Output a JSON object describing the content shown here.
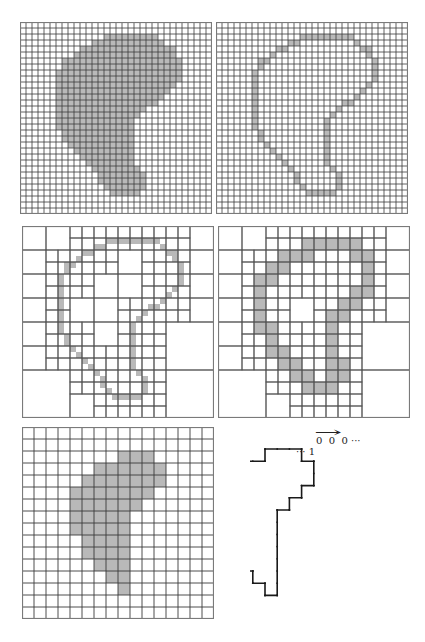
{
  "figure": {
    "colors": {
      "fill": "#b9b9b9",
      "grid_fine": "#3a3a3a",
      "grid_coarse": "#555555",
      "border": "#7a7a7a",
      "contour": "#1a1a1a"
    },
    "panels": [
      {
        "id": "fine-grid-filled",
        "x": 20,
        "y": 22,
        "size": 192,
        "n": 32,
        "mode": "fill",
        "rows": [
          [
            2,
            14,
            22
          ],
          [
            3,
            12,
            23
          ],
          [
            4,
            10,
            25
          ],
          [
            5,
            9,
            25
          ],
          [
            6,
            7,
            26
          ],
          [
            7,
            7,
            26
          ],
          [
            8,
            6,
            26
          ],
          [
            9,
            6,
            26
          ],
          [
            10,
            6,
            25
          ],
          [
            11,
            6,
            24
          ],
          [
            12,
            6,
            23
          ],
          [
            13,
            6,
            22
          ],
          [
            14,
            6,
            20
          ],
          [
            15,
            6,
            19
          ],
          [
            16,
            6,
            18
          ],
          [
            17,
            6,
            18
          ],
          [
            18,
            7,
            18
          ],
          [
            19,
            7,
            18
          ],
          [
            20,
            8,
            18
          ],
          [
            21,
            9,
            18
          ],
          [
            22,
            10,
            18
          ],
          [
            23,
            11,
            18
          ],
          [
            24,
            12,
            19
          ],
          [
            25,
            13,
            20
          ],
          [
            26,
            13,
            20
          ],
          [
            27,
            14,
            20
          ],
          [
            28,
            15,
            19
          ]
        ]
      },
      {
        "id": "fine-grid-boundary",
        "x": 216,
        "y": 22,
        "size": 192,
        "n": 32,
        "mode": "boundary",
        "rows": [
          [
            2,
            14,
            22
          ],
          [
            3,
            12,
            23
          ],
          [
            4,
            10,
            25
          ],
          [
            5,
            9,
            25
          ],
          [
            6,
            7,
            26
          ],
          [
            7,
            7,
            26
          ],
          [
            8,
            6,
            26
          ],
          [
            9,
            6,
            26
          ],
          [
            10,
            6,
            25
          ],
          [
            11,
            6,
            24
          ],
          [
            12,
            6,
            23
          ],
          [
            13,
            6,
            22
          ],
          [
            14,
            6,
            20
          ],
          [
            15,
            6,
            19
          ],
          [
            16,
            6,
            18
          ],
          [
            17,
            6,
            18
          ],
          [
            18,
            7,
            18
          ],
          [
            19,
            7,
            18
          ],
          [
            20,
            8,
            18
          ],
          [
            21,
            9,
            18
          ],
          [
            22,
            10,
            18
          ],
          [
            23,
            11,
            18
          ],
          [
            24,
            12,
            19
          ],
          [
            25,
            13,
            20
          ],
          [
            26,
            13,
            20
          ],
          [
            27,
            14,
            20
          ],
          [
            28,
            15,
            19
          ]
        ]
      },
      {
        "id": "quadtree-fine-boundary",
        "x": 22,
        "y": 226,
        "size": 192,
        "n": 16,
        "mode": "quadtree-fine",
        "rows": [
          [
            2,
            14,
            22
          ],
          [
            3,
            12,
            23
          ],
          [
            4,
            10,
            25
          ],
          [
            5,
            9,
            25
          ],
          [
            6,
            7,
            26
          ],
          [
            7,
            7,
            26
          ],
          [
            8,
            6,
            26
          ],
          [
            9,
            6,
            26
          ],
          [
            10,
            6,
            25
          ],
          [
            11,
            6,
            24
          ],
          [
            12,
            6,
            23
          ],
          [
            13,
            6,
            22
          ],
          [
            14,
            6,
            20
          ],
          [
            15,
            6,
            19
          ],
          [
            16,
            6,
            18
          ],
          [
            17,
            6,
            18
          ],
          [
            18,
            7,
            18
          ],
          [
            19,
            7,
            18
          ],
          [
            20,
            8,
            18
          ],
          [
            21,
            9,
            18
          ],
          [
            22,
            10,
            18
          ],
          [
            23,
            11,
            18
          ],
          [
            24,
            12,
            19
          ],
          [
            25,
            13,
            20
          ],
          [
            26,
            13,
            20
          ],
          [
            27,
            14,
            20
          ],
          [
            28,
            15,
            19
          ]
        ]
      },
      {
        "id": "quadtree-coarse-boundary",
        "x": 218,
        "y": 226,
        "size": 192,
        "n": 16,
        "mode": "quadtree-coarse",
        "cells": [
          [
            1,
            7
          ],
          [
            1,
            8
          ],
          [
            1,
            9
          ],
          [
            1,
            10
          ],
          [
            1,
            11
          ],
          [
            2,
            5
          ],
          [
            2,
            6
          ],
          [
            2,
            7
          ],
          [
            2,
            11
          ],
          [
            2,
            12
          ],
          [
            3,
            4
          ],
          [
            3,
            5
          ],
          [
            3,
            12
          ],
          [
            4,
            3
          ],
          [
            4,
            4
          ],
          [
            4,
            12
          ],
          [
            5,
            3
          ],
          [
            5,
            11
          ],
          [
            5,
            12
          ],
          [
            6,
            3
          ],
          [
            6,
            10
          ],
          [
            6,
            11
          ],
          [
            7,
            3
          ],
          [
            7,
            9
          ],
          [
            7,
            10
          ],
          [
            8,
            3
          ],
          [
            8,
            4
          ],
          [
            8,
            9
          ],
          [
            9,
            4
          ],
          [
            9,
            9
          ],
          [
            10,
            4
          ],
          [
            10,
            5
          ],
          [
            10,
            9
          ],
          [
            11,
            5
          ],
          [
            11,
            6
          ],
          [
            11,
            9
          ],
          [
            11,
            10
          ],
          [
            12,
            6
          ],
          [
            12,
            7
          ],
          [
            12,
            9
          ],
          [
            12,
            10
          ],
          [
            13,
            7
          ],
          [
            13,
            8
          ],
          [
            13,
            9
          ]
        ]
      },
      {
        "id": "coarse-grid-filled",
        "x": 22,
        "y": 427,
        "size": 192,
        "n": 16,
        "mode": "fill16",
        "rows": [
          [
            2,
            8,
            10
          ],
          [
            3,
            6,
            11
          ],
          [
            4,
            5,
            11
          ],
          [
            5,
            4,
            10
          ],
          [
            6,
            4,
            9
          ],
          [
            7,
            4,
            8
          ],
          [
            8,
            4,
            8
          ],
          [
            9,
            5,
            8
          ],
          [
            10,
            5,
            8
          ],
          [
            11,
            6,
            8
          ],
          [
            12,
            7,
            8
          ],
          [
            13,
            8,
            8
          ]
        ]
      },
      {
        "id": "chain-code-contour",
        "x": 250,
        "y": 430,
        "size": 175,
        "n": 16,
        "mode": "contour",
        "origin": [
          265,
          449
        ],
        "step": 12.2,
        "path": [
          [
            0,
            0
          ],
          [
            3,
            0
          ],
          [
            3,
            1
          ],
          [
            4,
            1
          ],
          [
            4,
            3
          ],
          [
            3,
            3
          ],
          [
            3,
            4
          ],
          [
            2,
            4
          ],
          [
            2,
            5
          ],
          [
            1,
            5
          ],
          [
            1,
            12
          ],
          [
            0,
            12
          ],
          [
            0,
            11
          ],
          [
            -1,
            11
          ],
          [
            -1,
            10
          ],
          [
            -2,
            10
          ],
          [
            -2,
            9
          ],
          [
            -3,
            9
          ],
          [
            -3,
            7
          ],
          [
            -4,
            7
          ],
          [
            -4,
            3
          ],
          [
            -3,
            3
          ],
          [
            -3,
            2
          ],
          [
            -2,
            2
          ],
          [
            -2,
            1
          ],
          [
            0,
            1
          ],
          [
            0,
            0
          ]
        ]
      }
    ],
    "chain_label": {
      "zeros": "0  0  0 ···",
      "one": "··· 1",
      "arrow": "→"
    }
  }
}
